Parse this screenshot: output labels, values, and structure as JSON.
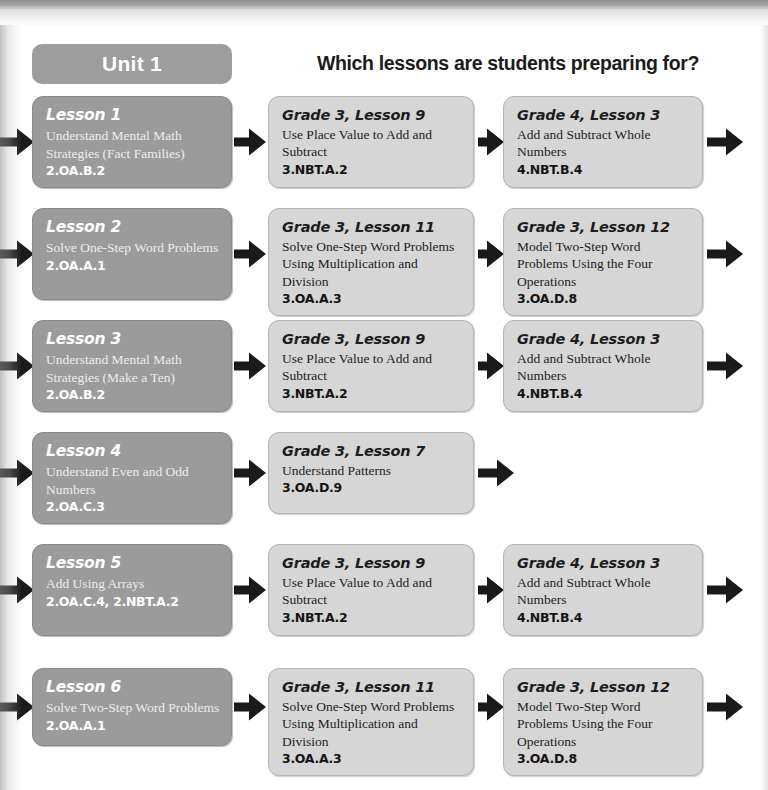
{
  "header": {
    "unit_badge": "Unit 1",
    "question": "Which lessons are students preparing for?"
  },
  "colors": {
    "dark_box": "#9b9b9b",
    "light_box": "#d6d6d6",
    "arrow": "#1a1a1a",
    "heading_text": "#1b1b1b",
    "dark_box_text": "#ffffff"
  },
  "rows": [
    {
      "lesson": {
        "title": "Lesson 1",
        "desc": "Understand Mental Math Strategies (Fact Families)",
        "code": "2.OA.B.2"
      },
      "targets": [
        {
          "title": "Grade 3, Lesson 9",
          "desc": "Use Place Value to Add and Subtract",
          "code": "3.NBT.A.2"
        },
        {
          "title": "Grade 4, Lesson 3",
          "desc": "Add and Subtract Whole Numbers",
          "code": "4.NBT.B.4"
        }
      ]
    },
    {
      "lesson": {
        "title": "Lesson 2",
        "desc": "Solve One-Step Word Problems",
        "code": "2.OA.A.1"
      },
      "targets": [
        {
          "title": "Grade  3, Lesson 11",
          "desc": "Solve One-Step Word Problems Using Multiplication and Division",
          "code": "3.OA.A.3"
        },
        {
          "title": "Grade 3, Lesson 12",
          "desc": "Model Two-Step Word Problems Using the Four Operations",
          "code": "3.OA.D.8"
        }
      ]
    },
    {
      "lesson": {
        "title": "Lesson 3",
        "desc": "Understand Mental Math Strategies (Make a Ten)",
        "code": "2.OA.B.2"
      },
      "targets": [
        {
          "title": "Grade 3, Lesson 9",
          "desc": "Use Place Value to Add and Subtract",
          "code": "3.NBT.A.2"
        },
        {
          "title": "Grade 4, Lesson 3",
          "desc": "Add and Subtract Whole Numbers",
          "code": "4.NBT.B.4"
        }
      ]
    },
    {
      "lesson": {
        "title": "Lesson 4",
        "desc": "Understand Even and Odd Numbers",
        "code": "2.OA.C.3"
      },
      "targets": [
        {
          "title": "Grade 3, Lesson 7",
          "desc": "Understand Patterns",
          "code": "3.OA.D.9"
        }
      ]
    },
    {
      "lesson": {
        "title": "Lesson 5",
        "desc": "Add Using Arrays",
        "code": "2.OA.C.4, 2.NBT.A.2"
      },
      "targets": [
        {
          "title": "Grade 3, Lesson 9",
          "desc": "Use Place Value to Add and Subtract",
          "code": "3.NBT.A.2"
        },
        {
          "title": "Grade 4, Lesson 3",
          "desc": "Add and Subtract Whole Numbers",
          "code": "4.NBT.B.4"
        }
      ]
    },
    {
      "lesson": {
        "title": "Lesson 6",
        "desc": "Solve Two-Step Word Problems",
        "code": "2.OA.A.1"
      },
      "targets": [
        {
          "title": "Grade  3, Lesson 11",
          "desc": "Solve One-Step Word Problems Using Multiplication and Division",
          "code": "3.OA.A.3"
        },
        {
          "title": "Grade 3, Lesson 12",
          "desc": "Model Two-Step Word Problems Using the Four Operations",
          "code": "3.OA.D.8"
        }
      ]
    }
  ],
  "layout": {
    "row_tops": [
      96,
      208,
      320,
      432,
      544,
      668
    ],
    "row_heights": [
      92,
      92,
      92,
      82,
      92,
      78
    ]
  }
}
